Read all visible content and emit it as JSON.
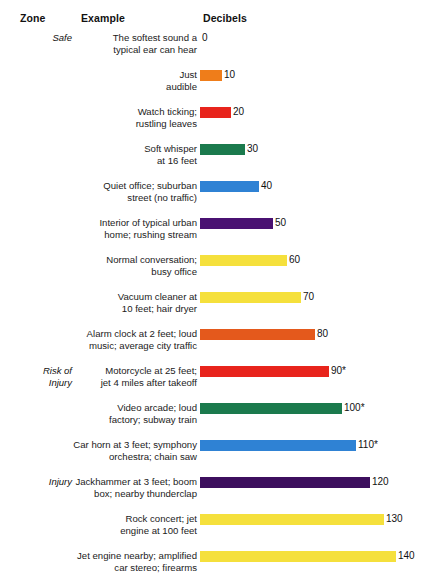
{
  "headers": {
    "zone": "Zone",
    "example": "Example",
    "decibels": "Decibels"
  },
  "chart_data": {
    "type": "bar",
    "orientation": "horizontal",
    "title": "",
    "xlabel": "Decibels",
    "ylabel": "Example",
    "xlim": [
      0,
      140
    ],
    "grid": false,
    "legend": false,
    "columns": [
      "Zone",
      "Example",
      "Decibels"
    ],
    "categories": [
      "The softest sound a typical ear can hear",
      "Just audible",
      "Watch ticking; rustling leaves",
      "Soft whisper at 16 feet",
      "Quiet office; suburban street (no traffic)",
      "Interior of typical urban home; rushing stream",
      "Normal conversation; busy office",
      "Vacuum cleaner at 10 feet; hair dryer",
      "Alarm clock at 2 feet; loud music; average city traffic",
      "Motorcycle at 25 feet; jet 4 miles after takeoff",
      "Video arcade; loud factory; subway train",
      "Car horn at 3 feet; symphony orchestra; chain saw",
      "Jackhammer at 3 feet; boom box; nearby thunderclap",
      "Rock concert; jet engine at 100 feet",
      "Jet engine nearby; amplified car stereo; firearms"
    ],
    "values": [
      0,
      10,
      20,
      30,
      40,
      50,
      60,
      70,
      80,
      90,
      100,
      110,
      120,
      130,
      140
    ],
    "value_labels": [
      "0",
      "10",
      "20",
      "30",
      "40",
      "50",
      "60",
      "70",
      "80",
      "90*",
      "100*",
      "110*",
      "120",
      "130",
      "140"
    ],
    "zones": [
      "Safe",
      "Risk of\nInjury",
      "Injury"
    ],
    "colors": [
      "#ef7d1a",
      "#ef7d1a",
      "#e8241c",
      "#1b7a4d",
      "#2f82d4",
      "#4a1172",
      "#f5e03c",
      "#f5e03c",
      "#e4591c",
      "#e8241c",
      "#1b7a4d",
      "#2f82d4",
      "#3d0f5e",
      "#f5e03c",
      "#f5e03c"
    ]
  },
  "rows": [
    {
      "zone": "Safe",
      "example": "The softest sound a\ntypical ear can hear",
      "value": 0,
      "label": "0",
      "color": "#ffffff",
      "bar_width": 0
    },
    {
      "zone": "",
      "example": "Just\naudible",
      "value": 10,
      "label": "10",
      "color": "#ef7d1a",
      "bar_width": 22
    },
    {
      "zone": "",
      "example": "Watch ticking;\nrustling leaves",
      "value": 20,
      "label": "20",
      "color": "#e8241c",
      "bar_width": 31
    },
    {
      "zone": "",
      "example": "Soft whisper\nat 16 feet",
      "value": 30,
      "label": "30",
      "color": "#1b7a4d",
      "bar_width": 45
    },
    {
      "zone": "",
      "example": "Quiet office; suburban\nstreet (no traffic)",
      "value": 40,
      "label": "40",
      "color": "#2f82d4",
      "bar_width": 59
    },
    {
      "zone": "",
      "example": "Interior of typical urban\nhome; rushing stream",
      "value": 50,
      "label": "50",
      "color": "#4a1172",
      "bar_width": 73
    },
    {
      "zone": "",
      "example": "Normal conversation;\nbusy office",
      "value": 60,
      "label": "60",
      "color": "#f5e03c",
      "bar_width": 87
    },
    {
      "zone": "",
      "example": "Vacuum cleaner at\n10 feet; hair dryer",
      "value": 70,
      "label": "70",
      "color": "#f5e03c",
      "bar_width": 101
    },
    {
      "zone": "",
      "example": "Alarm clock at 2 feet; loud\nmusic; average city traffic",
      "value": 80,
      "label": "80",
      "color": "#e4591c",
      "bar_width": 115
    },
    {
      "zone": "Risk of\nInjury",
      "example": "Motorcycle at 25 feet;\njet 4 miles after takeoff",
      "value": 90,
      "label": "90*",
      "color": "#e8241c",
      "bar_width": 129
    },
    {
      "zone": "",
      "example": "Video arcade; loud\nfactory; subway train",
      "value": 100,
      "label": "100*",
      "color": "#1b7a4d",
      "bar_width": 142
    },
    {
      "zone": "",
      "example": "Car horn at 3 feet; symphony\norchestra; chain saw",
      "value": 110,
      "label": "110*",
      "color": "#2f82d4",
      "bar_width": 156
    },
    {
      "zone": "Injury",
      "example": "Jackhammer at 3 feet; boom\nbox; nearby thunderclap",
      "value": 120,
      "label": "120",
      "color": "#3d0f5e",
      "bar_width": 170
    },
    {
      "zone": "",
      "example": "Rock concert; jet\nengine at 100 feet",
      "value": 130,
      "label": "130",
      "color": "#f5e03c",
      "bar_width": 184
    },
    {
      "zone": "",
      "example": "Jet engine nearby; amplified\ncar stereo; firearms",
      "value": 140,
      "label": "140",
      "color": "#f5e03c",
      "bar_width": 196
    }
  ]
}
